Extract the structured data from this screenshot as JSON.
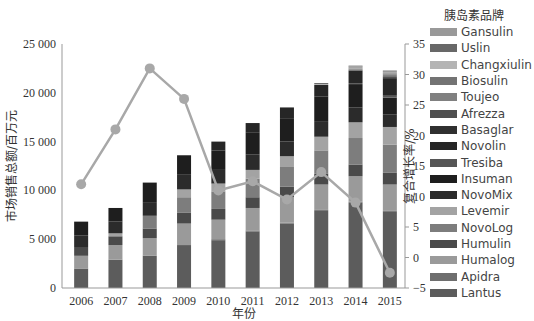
{
  "chart_data": {
    "type": "bar",
    "subtype": "stacked bar + line (dual axis)",
    "categories": [
      "2006",
      "2007",
      "2008",
      "2009",
      "2010",
      "2011",
      "2012",
      "2013",
      "2014",
      "2015"
    ],
    "xlabel": "年份",
    "ylabel": "市场销售总额/百万元",
    "ylabel_right": "复合增长率/%",
    "ylim": [
      0,
      25000
    ],
    "ylim_right": [
      -5,
      35
    ],
    "yticks": [
      "0",
      "5 000",
      "10 000",
      "15 000",
      "20 000",
      "25 000"
    ],
    "yticks_right": [
      "-5",
      "0",
      "5",
      "10",
      "15",
      "20",
      "25",
      "30",
      "35"
    ],
    "legend_title": "胰岛素品牌",
    "legend_position": "right",
    "grid": false,
    "totals": [
      6800,
      8200,
      10800,
      13600,
      15000,
      16900,
      18500,
      21000,
      22800,
      22300
    ],
    "series": [
      {
        "name": "Lantus",
        "color": "#5c5c5c",
        "values": [
          2000,
          2900,
          3300,
          4400,
          4900,
          5800,
          6600,
          7900,
          8700,
          7800
        ]
      },
      {
        "name": "Apidra",
        "color": "#6e6e6e",
        "values": [
          0,
          0,
          0,
          0,
          100,
          100,
          100,
          100,
          100,
          100
        ]
      },
      {
        "name": "Humalog",
        "color": "#9a9a9a",
        "values": [
          1300,
          1500,
          1800,
          2200,
          2000,
          2300,
          2600,
          2600,
          2600,
          2700
        ]
      },
      {
        "name": "Humulin",
        "color": "#4a4a4a",
        "values": [
          900,
          900,
          1000,
          1100,
          1100,
          1100,
          1100,
          1100,
          1200,
          1200
        ]
      },
      {
        "name": "NovoLog",
        "color": "#7d7d7d",
        "values": [
          0,
          0,
          1300,
          1600,
          1800,
          1900,
          2000,
          2400,
          2700,
          2900
        ]
      },
      {
        "name": "Levemir",
        "color": "#a3a3a3",
        "values": [
          0,
          300,
          0,
          800,
          800,
          900,
          1100,
          1400,
          1600,
          1800
        ]
      },
      {
        "name": "NovoMix",
        "color": "#2b2b2b",
        "values": [
          1200,
          1200,
          1400,
          1500,
          1400,
          1600,
          1500,
          1600,
          1500,
          1300
        ]
      },
      {
        "name": "Insuman",
        "color": "#1e1e1e",
        "values": [
          1400,
          1400,
          2000,
          2000,
          2000,
          2200,
          2400,
          2500,
          2400,
          1700
        ]
      },
      {
        "name": "Tresiba",
        "color": "#565656",
        "values": [
          0,
          0,
          0,
          0,
          0,
          0,
          0,
          0,
          100,
          200
        ]
      },
      {
        "name": "Novolin",
        "color": "#262626",
        "values": [
          0,
          0,
          0,
          0,
          900,
          1000,
          1100,
          1200,
          1300,
          1800
        ]
      },
      {
        "name": "Basaglar",
        "color": "#303030",
        "values": [
          0,
          0,
          0,
          0,
          0,
          0,
          0,
          0,
          0,
          100
        ]
      },
      {
        "name": "Afrezza",
        "color": "#4f4f4f",
        "values": [
          0,
          0,
          0,
          0,
          0,
          0,
          0,
          0,
          0,
          100
        ]
      },
      {
        "name": "Toujeo",
        "color": "#808080",
        "values": [
          0,
          0,
          0,
          0,
          0,
          0,
          0,
          0,
          100,
          200
        ]
      },
      {
        "name": "Biosulin",
        "color": "#737373",
        "values": [
          0,
          0,
          0,
          0,
          0,
          0,
          0,
          0,
          100,
          100
        ]
      },
      {
        "name": "Changxiulin",
        "color": "#b4b4b4",
        "values": [
          0,
          0,
          0,
          0,
          0,
          0,
          0,
          100,
          100,
          100
        ]
      },
      {
        "name": "Uslin",
        "color": "#686868",
        "values": [
          0,
          0,
          0,
          0,
          0,
          0,
          0,
          100,
          100,
          100
        ]
      },
      {
        "name": "Gansulin",
        "color": "#999999",
        "values": [
          0,
          0,
          0,
          0,
          0,
          0,
          0,
          0,
          100,
          100
        ]
      }
    ],
    "line": {
      "name": "复合增长率",
      "axis": "right",
      "color": "#a8a8a8",
      "values": [
        12,
        21,
        31,
        26,
        11,
        12.5,
        9.5,
        14,
        9,
        -2.5
      ]
    }
  },
  "legend": {
    "title": "胰岛素品牌",
    "items": [
      {
        "label": "Gansulin",
        "color": "#999999"
      },
      {
        "label": "Uslin",
        "color": "#686868"
      },
      {
        "label": "Changxiulin",
        "color": "#b4b4b4"
      },
      {
        "label": "Biosulin",
        "color": "#737373"
      },
      {
        "label": "Toujeo",
        "color": "#808080"
      },
      {
        "label": "Afrezza",
        "color": "#4f4f4f"
      },
      {
        "label": "Basaglar",
        "color": "#303030"
      },
      {
        "label": "Novolin",
        "color": "#262626"
      },
      {
        "label": "Tresiba",
        "color": "#565656"
      },
      {
        "label": "Insuman",
        "color": "#1e1e1e"
      },
      {
        "label": "NovoMix",
        "color": "#2b2b2b"
      },
      {
        "label": "Levemir",
        "color": "#a3a3a3"
      },
      {
        "label": "NovoLog",
        "color": "#7d7d7d"
      },
      {
        "label": "Humulin",
        "color": "#4a4a4a"
      },
      {
        "label": "Humalog",
        "color": "#9a9a9a"
      },
      {
        "label": "Apidra",
        "color": "#6e6e6e"
      },
      {
        "label": "Lantus",
        "color": "#5c5c5c"
      }
    ]
  }
}
